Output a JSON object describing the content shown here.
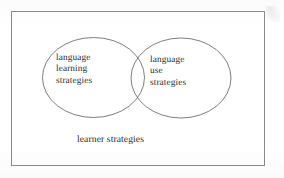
{
  "figure": {
    "kind": "venn-diagram",
    "background_color": "#fdfdfd",
    "stroke_color": "#6e6e6e",
    "text_color": "#2b2b2b",
    "frame": {
      "name": "outer-rectangle",
      "x": 11,
      "y": 11,
      "width": 253,
      "height": 154
    },
    "caption": "learner strategies",
    "sets": [
      {
        "id": "left",
        "label_lines": [
          "language",
          "learning",
          "strategies"
        ],
        "cx": 93.5,
        "cy": 77.5,
        "rx": 51,
        "ry": 40
      },
      {
        "id": "right",
        "label_lines": [
          "language",
          "use",
          "strategies"
        ],
        "cx": 181,
        "cy": 78,
        "rx": 50,
        "ry": 40
      }
    ]
  }
}
